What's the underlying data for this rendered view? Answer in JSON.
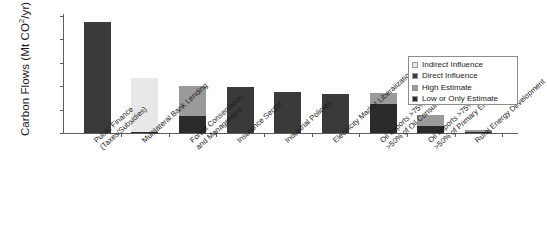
{
  "chart_data": {
    "type": "bar",
    "subtype": "stacked",
    "title": "",
    "xlabel": "",
    "ylabel": "Carbon Flows (Mt CO2/yr)",
    "ylabel_main": "Carbon Flows (Mt CO",
    "ylabel_sup": "2",
    "ylabel_tail": "/yr)",
    "ylim": [
      0,
      25000
    ],
    "grid": false,
    "legend_position": "right-inside",
    "y_ticks": [
      0,
      5000,
      10000,
      15000,
      20000,
      25000
    ],
    "y_tick_labels": [
      "0",
      "5,000",
      "10,000",
      "15,000",
      "20,000",
      "25,000"
    ],
    "categories": [
      "Public Finance (Taxes/Subsidies)",
      "Multilateral Bank Lending",
      "Forest Conservation and Management",
      "Insurance Sector",
      "Industrial Policies",
      "Electricity Market Liberalization",
      "Oil Imports >75% and >50% of Oil Consumption",
      "Oil Imports >75% and >50% of Primary Energy",
      "Rural Energy Development"
    ],
    "category_lines": [
      [
        "Public Finance",
        "(Taxes/Subsidies)"
      ],
      [
        "Multilateral Bank Lending",
        ""
      ],
      [
        "Forest Conservation",
        "and Management"
      ],
      [
        "Insurance Sector",
        ""
      ],
      [
        "Industrial Policies",
        ""
      ],
      [
        "Electricity Market Liberalization",
        ""
      ],
      [
        "Oil Imports >75% and",
        ">50% of Oil Consumption"
      ],
      [
        "Oil Imports >75% and",
        ">50% of Primary Energy"
      ],
      [
        "Rural Energy Development",
        ""
      ]
    ],
    "series": [
      {
        "name": "Indirect Influence",
        "color": "#e8e8e8",
        "values": [
          0,
          11500,
          0,
          0,
          0,
          0,
          0,
          0,
          0
        ]
      },
      {
        "name": "Direct Influence",
        "color": "#3a3a3a",
        "values": [
          23800,
          0,
          0,
          9750,
          8700,
          8300,
          0,
          0,
          0
        ]
      },
      {
        "name": "High Estimate",
        "color": "#9a9a9a",
        "values": [
          0,
          0,
          6400,
          0,
          0,
          0,
          2200,
          2400,
          500
        ]
      },
      {
        "name": "Low or Only Estimate",
        "color": "#2b2b2b",
        "values": [
          0,
          300,
          3650,
          0,
          0,
          0,
          6300,
          1500,
          100
        ]
      }
    ],
    "stack_order": [
      "Low or Only Estimate",
      "Direct Influence",
      "High Estimate",
      "Indirect Influence"
    ],
    "bars": [
      {
        "category": "Public Finance (Taxes/Subsidies)",
        "total": 23800,
        "segments": [
          {
            "series": "Direct Influence",
            "value": 23800,
            "color": "#3a3a3a"
          }
        ]
      },
      {
        "category": "Multilateral Bank Lending",
        "total": 11800,
        "segments": [
          {
            "series": "Low or Only Estimate",
            "value": 300,
            "color": "#2b2b2b"
          },
          {
            "series": "Indirect Influence",
            "value": 11500,
            "color": "#e8e8e8"
          }
        ]
      },
      {
        "category": "Forest Conservation and Management",
        "total": 10050,
        "segments": [
          {
            "series": "Low or Only Estimate",
            "value": 3650,
            "color": "#2b2b2b"
          },
          {
            "series": "High Estimate",
            "value": 6400,
            "color": "#9a9a9a"
          }
        ]
      },
      {
        "category": "Insurance Sector",
        "total": 9750,
        "segments": [
          {
            "series": "Direct Influence",
            "value": 9750,
            "color": "#3a3a3a"
          }
        ]
      },
      {
        "category": "Industrial Policies",
        "total": 8700,
        "segments": [
          {
            "series": "Direct Influence",
            "value": 8700,
            "color": "#3a3a3a"
          }
        ]
      },
      {
        "category": "Electricity Market Liberalization",
        "total": 8300,
        "segments": [
          {
            "series": "Direct Influence",
            "value": 8300,
            "color": "#3a3a3a"
          }
        ]
      },
      {
        "category": "Oil Imports >75% and >50% of Oil Consumption",
        "total": 8500,
        "segments": [
          {
            "series": "Low or Only Estimate",
            "value": 6300,
            "color": "#2b2b2b"
          },
          {
            "series": "High Estimate",
            "value": 2200,
            "color": "#9a9a9a"
          }
        ]
      },
      {
        "category": "Oil Imports >75% and >50% of Primary Energy",
        "total": 3900,
        "segments": [
          {
            "series": "Low or Only Estimate",
            "value": 1500,
            "color": "#2b2b2b"
          },
          {
            "series": "High Estimate",
            "value": 2400,
            "color": "#9a9a9a"
          }
        ]
      },
      {
        "category": "Rural Energy Development",
        "total": 600,
        "segments": [
          {
            "series": "Low or Only Estimate",
            "value": 100,
            "color": "#2b2b2b"
          },
          {
            "series": "High Estimate",
            "value": 500,
            "color": "#9a9a9a"
          }
        ]
      }
    ],
    "legend": [
      {
        "label": "Indirect Influence",
        "color": "#e8e8e8"
      },
      {
        "label": "Direct Influence",
        "color": "#3a3a3a"
      },
      {
        "label": "High Estimate",
        "color": "#9a9a9a"
      },
      {
        "label": "Low or Only Estimate",
        "color": "#2b2b2b"
      }
    ]
  }
}
